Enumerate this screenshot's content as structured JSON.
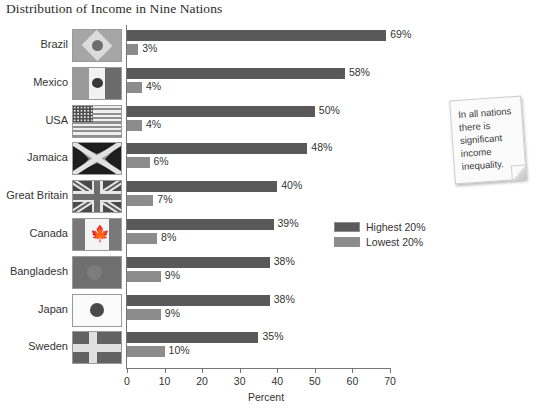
{
  "chart_data": {
    "type": "bar",
    "orientation": "horizontal",
    "title": "Distribution of Income in Nine Nations",
    "xlabel": "Percent",
    "ylabel": "",
    "xlim": [
      0,
      70
    ],
    "xticks": [
      0,
      10,
      20,
      30,
      40,
      50,
      60,
      70
    ],
    "xtick_labels": [
      "0",
      "10",
      "20",
      "30",
      "40",
      "50",
      "60",
      "70"
    ],
    "grid": false,
    "legend_position": "middle-right",
    "categories": [
      "Brazil",
      "Mexico",
      "USA",
      "Jamaica",
      "Great Britain",
      "Canada",
      "Bangladesh",
      "Japan",
      "Sweden"
    ],
    "series": [
      {
        "name": "Highest 20%",
        "color": "#595959",
        "values": [
          69,
          58,
          50,
          48,
          40,
          39,
          38,
          38,
          35
        ],
        "value_labels": [
          "69%",
          "58%",
          "50%",
          "48%",
          "40%",
          "39%",
          "38%",
          "38%",
          "35%"
        ]
      },
      {
        "name": "Lowest 20%",
        "color": "#8c8c8c",
        "values": [
          3,
          4,
          4,
          6,
          7,
          8,
          9,
          9,
          10
        ],
        "value_labels": [
          "3%",
          "4%",
          "4%",
          "6%",
          "7%",
          "8%",
          "9%",
          "9%",
          "10%"
        ]
      }
    ],
    "annotations": [
      {
        "type": "sticky-note",
        "text": "In all nations there is significant income inequality."
      }
    ]
  },
  "title": "Distribution of Income in Nine Nations",
  "axis": {
    "x_title": "Percent",
    "ticks": [
      "0",
      "10",
      "20",
      "30",
      "40",
      "50",
      "60",
      "70"
    ]
  },
  "rows": [
    {
      "label": "Brazil",
      "flag": "brazil-flag-icon",
      "high": "69%",
      "low": "3%"
    },
    {
      "label": "Mexico",
      "flag": "mexico-flag-icon",
      "high": "58%",
      "low": "4%"
    },
    {
      "label": "USA",
      "flag": "usa-flag-icon",
      "high": "50%",
      "low": "4%"
    },
    {
      "label": "Jamaica",
      "flag": "jamaica-flag-icon",
      "high": "48%",
      "low": "6%"
    },
    {
      "label": "Great Britain",
      "flag": "great-britain-flag-icon",
      "high": "40%",
      "low": "7%"
    },
    {
      "label": "Canada",
      "flag": "canada-flag-icon",
      "high": "39%",
      "low": "8%"
    },
    {
      "label": "Bangladesh",
      "flag": "bangladesh-flag-icon",
      "high": "38%",
      "low": "9%"
    },
    {
      "label": "Japan",
      "flag": "japan-flag-icon",
      "high": "38%",
      "low": "9%"
    },
    {
      "label": "Sweden",
      "flag": "sweden-flag-icon",
      "high": "35%",
      "low": "10%"
    }
  ],
  "legend": {
    "items": [
      {
        "label": "Highest 20%",
        "color": "#595959"
      },
      {
        "label": "Lowest 20%",
        "color": "#8c8c8c"
      }
    ]
  },
  "note": {
    "text": "In all nations there is significant income inequality."
  }
}
